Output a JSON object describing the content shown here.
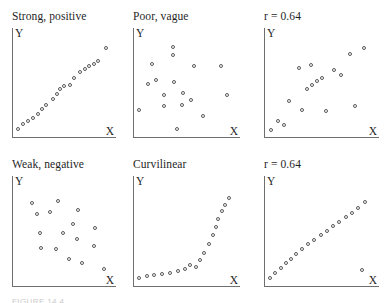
{
  "figure": {
    "caption": "FIGURE 14.4",
    "point_color": "#585858",
    "axis_color": "#6f6f6f",
    "text_color": "#1f1f1f",
    "background": "#ffffff"
  },
  "chart_data": [
    {
      "type": "scatter",
      "title": "Strong, positive",
      "xlabel": "X",
      "ylabel": "Y",
      "xlim": [
        0,
        100
      ],
      "ylim": [
        0,
        100
      ],
      "grid": false,
      "legend": "none",
      "points": [
        {
          "x": 3,
          "y": 4
        },
        {
          "x": 9,
          "y": 10
        },
        {
          "x": 14,
          "y": 13
        },
        {
          "x": 19,
          "y": 17
        },
        {
          "x": 24,
          "y": 21
        },
        {
          "x": 29,
          "y": 27
        },
        {
          "x": 33,
          "y": 31
        },
        {
          "x": 40,
          "y": 38
        },
        {
          "x": 45,
          "y": 44
        },
        {
          "x": 48,
          "y": 49
        },
        {
          "x": 52,
          "y": 53
        },
        {
          "x": 58,
          "y": 54
        },
        {
          "x": 63,
          "y": 62
        },
        {
          "x": 69,
          "y": 68
        },
        {
          "x": 74,
          "y": 72
        },
        {
          "x": 79,
          "y": 75
        },
        {
          "x": 84,
          "y": 78
        },
        {
          "x": 88,
          "y": 81
        },
        {
          "x": 97,
          "y": 95
        }
      ]
    },
    {
      "type": "scatter",
      "title": "Poor, vague",
      "xlabel": "X",
      "ylabel": "Y",
      "xlim": [
        0,
        100
      ],
      "ylim": [
        0,
        100
      ],
      "grid": false,
      "legend": "none",
      "points": [
        {
          "x": 38,
          "y": 97
        },
        {
          "x": 38,
          "y": 88
        },
        {
          "x": 17,
          "y": 77
        },
        {
          "x": 60,
          "y": 75
        },
        {
          "x": 88,
          "y": 75
        },
        {
          "x": 21,
          "y": 60
        },
        {
          "x": 12,
          "y": 55
        },
        {
          "x": 39,
          "y": 57
        },
        {
          "x": 29,
          "y": 43
        },
        {
          "x": 48,
          "y": 45
        },
        {
          "x": 94,
          "y": 43
        },
        {
          "x": 57,
          "y": 37
        },
        {
          "x": 29,
          "y": 30
        },
        {
          "x": 47,
          "y": 32
        },
        {
          "x": 3,
          "y": 26
        },
        {
          "x": 69,
          "y": 19
        },
        {
          "x": 42,
          "y": 5
        }
      ]
    },
    {
      "type": "scatter",
      "title": "r = 0.64",
      "xlabel": "X",
      "ylabel": "Y",
      "xlim": [
        0,
        100
      ],
      "ylim": [
        0,
        100
      ],
      "grid": false,
      "legend": "none",
      "points": [
        {
          "x": 92,
          "y": 95
        },
        {
          "x": 79,
          "y": 89
        },
        {
          "x": 30,
          "y": 73
        },
        {
          "x": 42,
          "y": 76
        },
        {
          "x": 64,
          "y": 71
        },
        {
          "x": 70,
          "y": 65
        },
        {
          "x": 52,
          "y": 62
        },
        {
          "x": 48,
          "y": 58
        },
        {
          "x": 43,
          "y": 54
        },
        {
          "x": 38,
          "y": 50
        },
        {
          "x": 21,
          "y": 36
        },
        {
          "x": 33,
          "y": 26
        },
        {
          "x": 56,
          "y": 25
        },
        {
          "x": 84,
          "y": 30
        },
        {
          "x": 10,
          "y": 13
        },
        {
          "x": 16,
          "y": 9
        },
        {
          "x": 4,
          "y": 3
        }
      ]
    },
    {
      "type": "scatter",
      "title": "Weak, negative",
      "xlabel": "X",
      "ylabel": "Y",
      "xlim": [
        0,
        100
      ],
      "ylim": [
        0,
        100
      ],
      "grid": false,
      "legend": "none",
      "points": [
        {
          "x": 18,
          "y": 88
        },
        {
          "x": 46,
          "y": 90
        },
        {
          "x": 67,
          "y": 80
        },
        {
          "x": 23,
          "y": 76
        },
        {
          "x": 37,
          "y": 78
        },
        {
          "x": 62,
          "y": 65
        },
        {
          "x": 85,
          "y": 60
        },
        {
          "x": 27,
          "y": 55
        },
        {
          "x": 51,
          "y": 54
        },
        {
          "x": 66,
          "y": 48
        },
        {
          "x": 84,
          "y": 40
        },
        {
          "x": 28,
          "y": 38
        },
        {
          "x": 44,
          "y": 37
        },
        {
          "x": 57,
          "y": 26
        },
        {
          "x": 71,
          "y": 21
        },
        {
          "x": 95,
          "y": 14
        }
      ]
    },
    {
      "type": "scatter",
      "title": "Curvilinear",
      "xlabel": "X",
      "ylabel": "Y",
      "xlim": [
        0,
        100
      ],
      "ylim": [
        0,
        100
      ],
      "grid": false,
      "legend": "none",
      "points": [
        {
          "x": 3,
          "y": 5
        },
        {
          "x": 11,
          "y": 7
        },
        {
          "x": 19,
          "y": 8
        },
        {
          "x": 27,
          "y": 9
        },
        {
          "x": 35,
          "y": 10
        },
        {
          "x": 43,
          "y": 12
        },
        {
          "x": 50,
          "y": 15
        },
        {
          "x": 56,
          "y": 19
        },
        {
          "x": 62,
          "y": 17
        },
        {
          "x": 66,
          "y": 24
        },
        {
          "x": 70,
          "y": 32
        },
        {
          "x": 75,
          "y": 42
        },
        {
          "x": 79,
          "y": 52
        },
        {
          "x": 82,
          "y": 61
        },
        {
          "x": 85,
          "y": 70
        },
        {
          "x": 89,
          "y": 79
        },
        {
          "x": 92,
          "y": 86
        },
        {
          "x": 96,
          "y": 93
        }
      ]
    },
    {
      "type": "scatter",
      "title": "r = 0.64",
      "xlabel": "X",
      "ylabel": "Y",
      "xlim": [
        0,
        100
      ],
      "ylim": [
        0,
        100
      ],
      "grid": false,
      "legend": "none",
      "points": [
        {
          "x": 3,
          "y": 4
        },
        {
          "x": 8,
          "y": 10
        },
        {
          "x": 13,
          "y": 16
        },
        {
          "x": 18,
          "y": 21
        },
        {
          "x": 23,
          "y": 26
        },
        {
          "x": 28,
          "y": 31
        },
        {
          "x": 33,
          "y": 37
        },
        {
          "x": 39,
          "y": 42
        },
        {
          "x": 45,
          "y": 47
        },
        {
          "x": 51,
          "y": 52
        },
        {
          "x": 57,
          "y": 57
        },
        {
          "x": 63,
          "y": 62
        },
        {
          "x": 69,
          "y": 67
        },
        {
          "x": 75,
          "y": 72
        },
        {
          "x": 81,
          "y": 77
        },
        {
          "x": 87,
          "y": 82
        },
        {
          "x": 93,
          "y": 89
        },
        {
          "x": 90,
          "y": 13
        }
      ]
    }
  ]
}
